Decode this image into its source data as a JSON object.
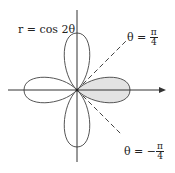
{
  "diagram": {
    "title": "r = cos 2θ",
    "equation_label": "r = cos 2θ",
    "upper_line_label": {
      "lhs": "θ = ",
      "sign": "",
      "numerator": "π",
      "denominator": "4"
    },
    "lower_line_label": {
      "lhs": "θ = ",
      "sign": "−",
      "numerator": "π",
      "denominator": "4"
    },
    "curve": "four-leaved rose r = cos 2θ",
    "shaded_region": "right petal, −π/4 ≤ θ ≤ π/4",
    "colors": {
      "curve": "#555555",
      "shade": "#e3e3e3",
      "axis": "#333333",
      "dashed": "#444444"
    }
  }
}
